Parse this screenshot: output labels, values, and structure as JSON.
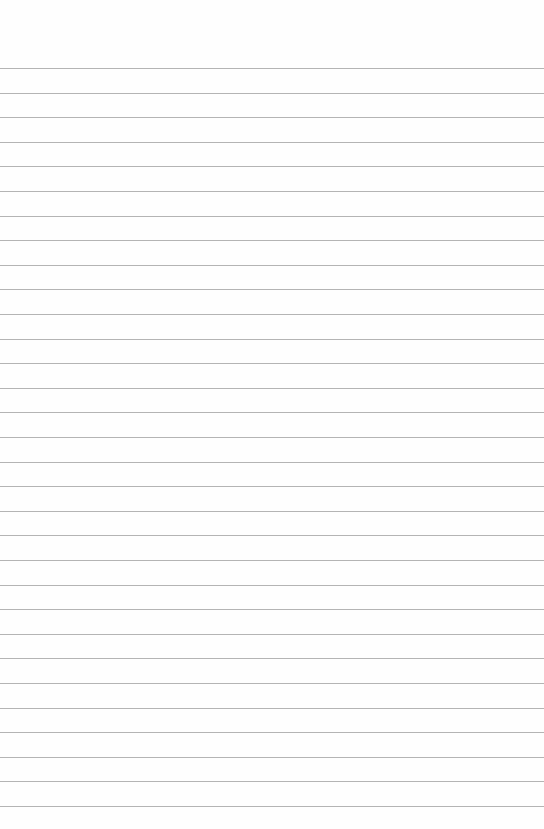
{
  "page": {
    "type": "lined-paper",
    "background_color": "#fefefe",
    "line_color": "#b4b4b4",
    "line_count": 31,
    "first_line_y": 68,
    "line_spacing": 24.6
  }
}
